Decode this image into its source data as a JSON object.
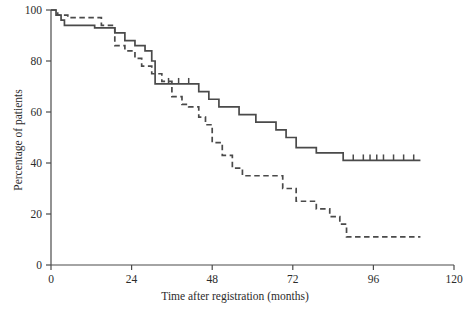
{
  "chart_data": {
    "type": "line",
    "title": "",
    "subtitle": "",
    "xlabel": "Time after registration (months)",
    "ylabel": "Percentage of patients",
    "xlim": [
      0,
      120
    ],
    "ylim": [
      0,
      100
    ],
    "xticks": [
      0,
      24,
      48,
      72,
      96,
      120
    ],
    "xtick_labels": [
      "0",
      "24",
      "48",
      "72",
      "96",
      "120"
    ],
    "yticks": [
      0,
      20,
      40,
      60,
      80,
      100
    ],
    "ytick_labels": [
      "0",
      "20",
      "40",
      "60",
      "80",
      "100"
    ],
    "grid": false,
    "legend": "none",
    "style": "kaplan-meier step curves with censoring ticks",
    "series": [
      {
        "name": "solid-curve",
        "linestyle": "solid",
        "color": "#4a4a4a",
        "points": [
          [
            0,
            100
          ],
          [
            1.5,
            100
          ],
          [
            1.5,
            98
          ],
          [
            3,
            98
          ],
          [
            3,
            96
          ],
          [
            4,
            96
          ],
          [
            4,
            94
          ],
          [
            13,
            94
          ],
          [
            13,
            93
          ],
          [
            19,
            93
          ],
          [
            19,
            91
          ],
          [
            22,
            91
          ],
          [
            22,
            88
          ],
          [
            25,
            88
          ],
          [
            25,
            86
          ],
          [
            28,
            86
          ],
          [
            28,
            84
          ],
          [
            30,
            84
          ],
          [
            30,
            80
          ],
          [
            31,
            80
          ],
          [
            31,
            71
          ],
          [
            44,
            71
          ],
          [
            44,
            68
          ],
          [
            47,
            68
          ],
          [
            47,
            65
          ],
          [
            50,
            65
          ],
          [
            50,
            62
          ],
          [
            56,
            62
          ],
          [
            56,
            59
          ],
          [
            61,
            59
          ],
          [
            61,
            56
          ],
          [
            67,
            56
          ],
          [
            67,
            53
          ],
          [
            70,
            53
          ],
          [
            70,
            50
          ],
          [
            73,
            50
          ],
          [
            73,
            46
          ],
          [
            79,
            46
          ],
          [
            79,
            44
          ],
          [
            87,
            44
          ],
          [
            87,
            41
          ],
          [
            110,
            41
          ]
        ],
        "censor_times": [
          35,
          38,
          41,
          90,
          93,
          95,
          97,
          99,
          102,
          105,
          108
        ],
        "censor_values": [
          71,
          71,
          71,
          41,
          41,
          41,
          41,
          41,
          41,
          41,
          41
        ]
      },
      {
        "name": "dashed-curve",
        "linestyle": "dashed",
        "color": "#4a4a4a",
        "points": [
          [
            0,
            100
          ],
          [
            2,
            100
          ],
          [
            2,
            98
          ],
          [
            5,
            98
          ],
          [
            5,
            97
          ],
          [
            15,
            97
          ],
          [
            15,
            94
          ],
          [
            19,
            94
          ],
          [
            19,
            86
          ],
          [
            22,
            86
          ],
          [
            22,
            84
          ],
          [
            25,
            84
          ],
          [
            25,
            81
          ],
          [
            27,
            81
          ],
          [
            27,
            78
          ],
          [
            30,
            78
          ],
          [
            30,
            75
          ],
          [
            33,
            75
          ],
          [
            33,
            72
          ],
          [
            36,
            72
          ],
          [
            36,
            66
          ],
          [
            39,
            66
          ],
          [
            39,
            63
          ],
          [
            41,
            63
          ],
          [
            41,
            62
          ],
          [
            44,
            62
          ],
          [
            44,
            58
          ],
          [
            46,
            58
          ],
          [
            46,
            55
          ],
          [
            48,
            55
          ],
          [
            48,
            48
          ],
          [
            51,
            48
          ],
          [
            51,
            43
          ],
          [
            54,
            43
          ],
          [
            54,
            38
          ],
          [
            57,
            38
          ],
          [
            57,
            35
          ],
          [
            69,
            35
          ],
          [
            69,
            30
          ],
          [
            73,
            30
          ],
          [
            73,
            25
          ],
          [
            79,
            25
          ],
          [
            79,
            22
          ],
          [
            83,
            22
          ],
          [
            83,
            19
          ],
          [
            86,
            19
          ],
          [
            86,
            16
          ],
          [
            88,
            16
          ],
          [
            88,
            11
          ],
          [
            110,
            11
          ]
        ],
        "censor_times": [],
        "censor_values": []
      }
    ]
  },
  "axes": {
    "ylabel": "Percentage of patients",
    "xlabel": "Time after registration (months)"
  }
}
